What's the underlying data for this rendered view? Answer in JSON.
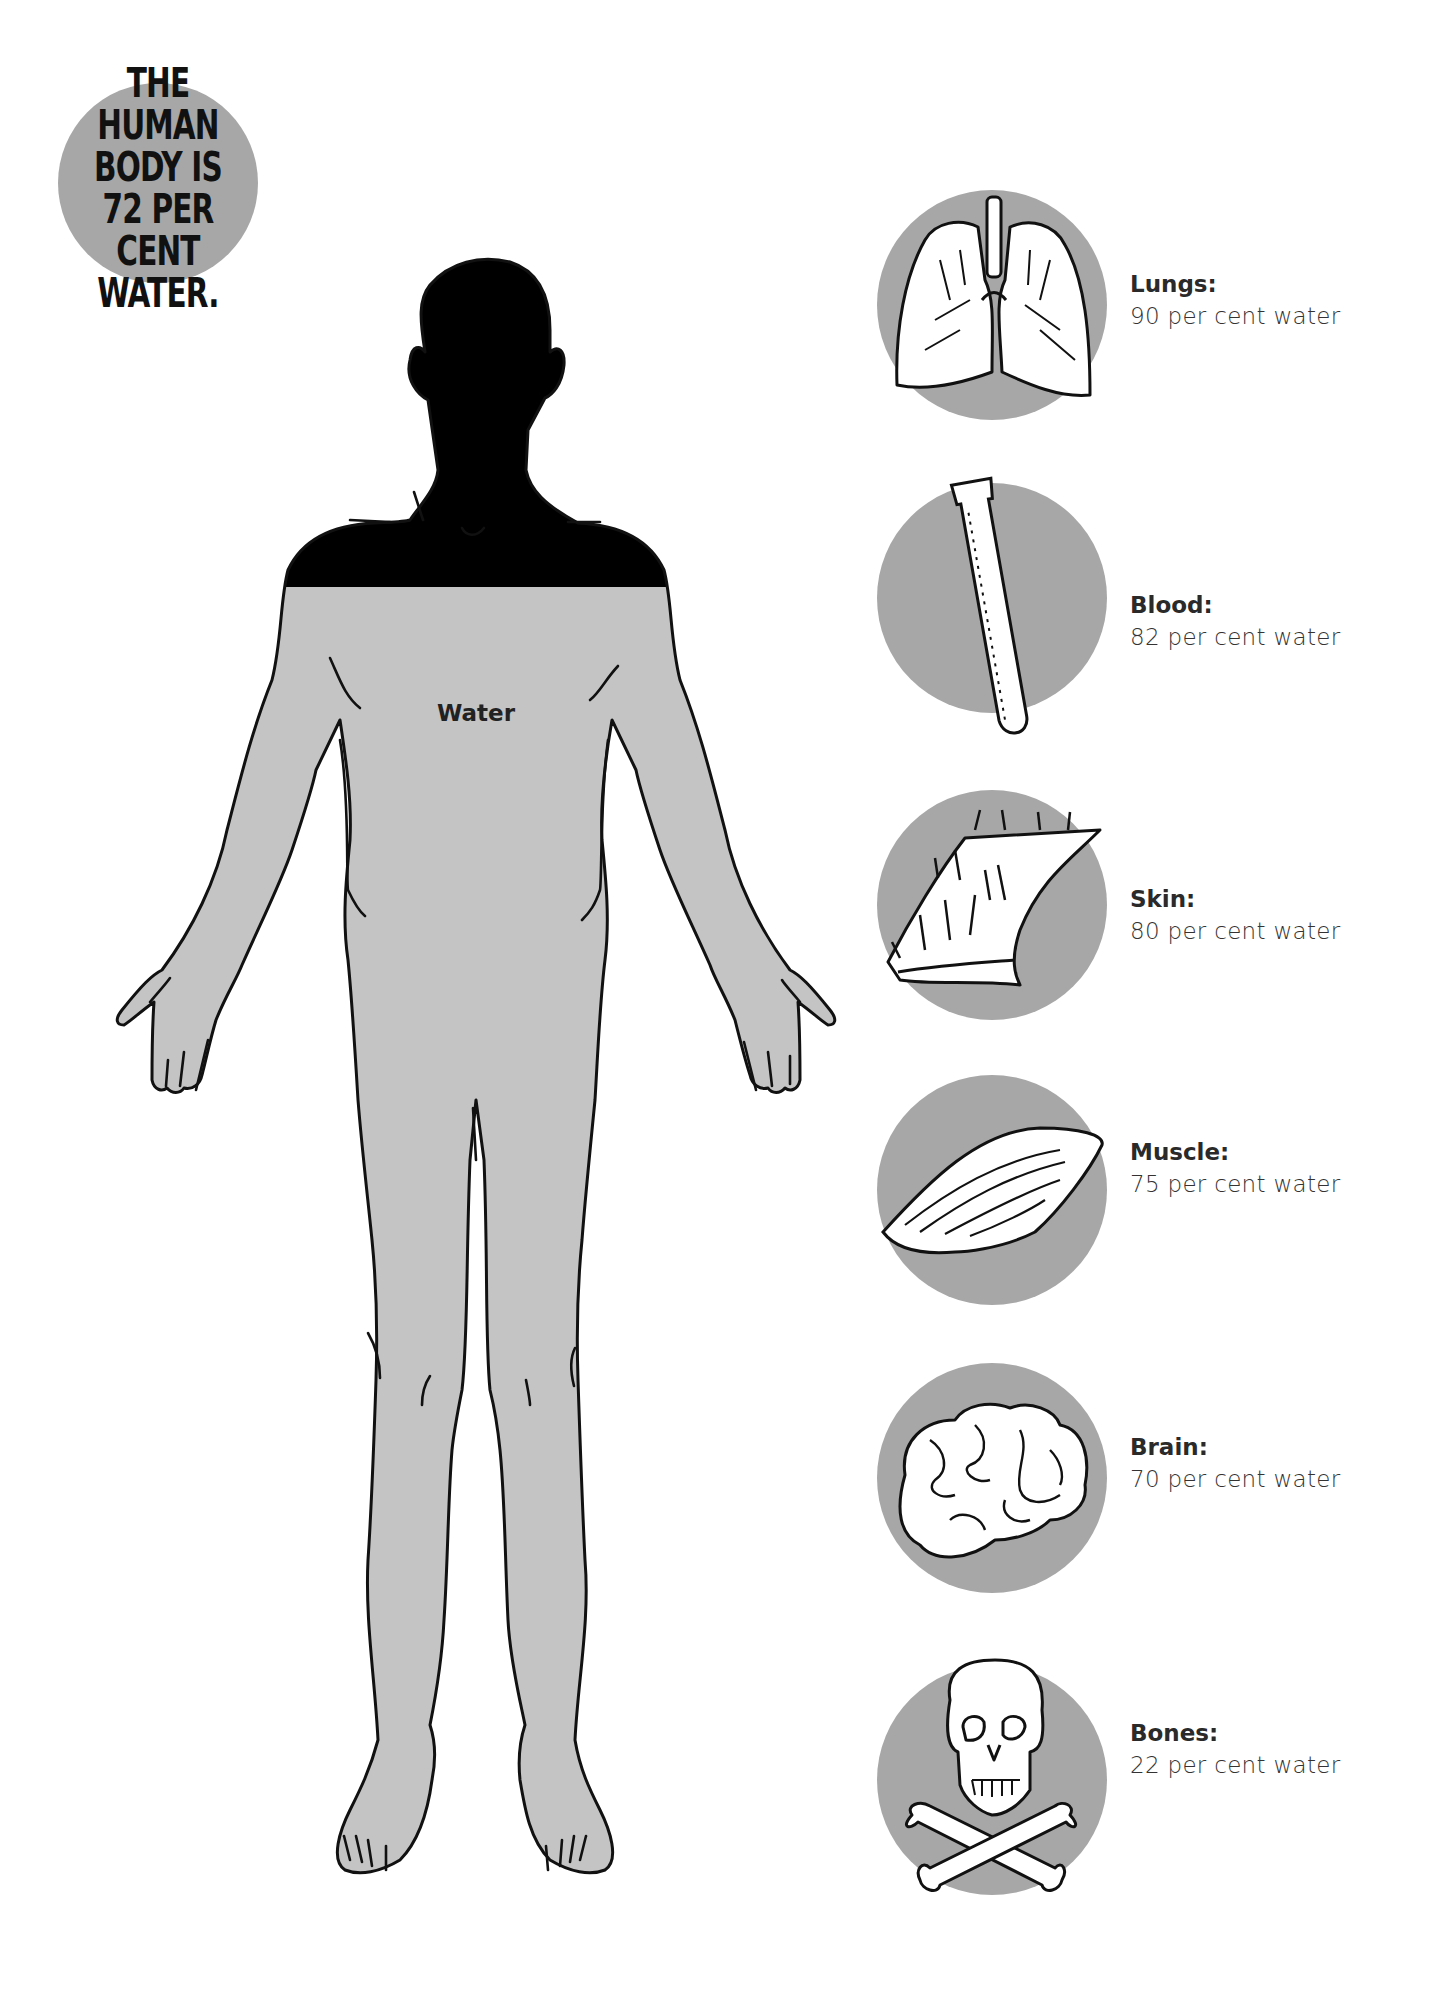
{
  "title_badge": {
    "text": "THE HUMAN\nBODY IS\n72 PER CENT\nWATER.",
    "color": "#a7a7a7"
  },
  "body_figure": {
    "label": "Water",
    "water_percent": 72,
    "fill_color": "#c4c4c4"
  },
  "organs": [
    {
      "name": "Lungs:",
      "value": "90 per cent water",
      "percent": 90,
      "icon": "lungs-icon"
    },
    {
      "name": "Blood:",
      "value": "82 per cent water",
      "percent": 82,
      "icon": "test-tube-icon"
    },
    {
      "name": "Skin:",
      "value": "80 per cent water",
      "percent": 80,
      "icon": "skin-icon"
    },
    {
      "name": "Muscle:",
      "value": "75 per cent water",
      "percent": 75,
      "icon": "muscle-icon"
    },
    {
      "name": "Brain:",
      "value": "70 per cent water",
      "percent": 70,
      "icon": "brain-icon"
    },
    {
      "name": "Bones:",
      "value": "22 per cent water",
      "percent": 22,
      "icon": "skull-crossbones-icon"
    }
  ],
  "colors": {
    "circle_gray": "#a7a7a7",
    "water_gray": "#c4c4c4",
    "outline": "#111111"
  }
}
